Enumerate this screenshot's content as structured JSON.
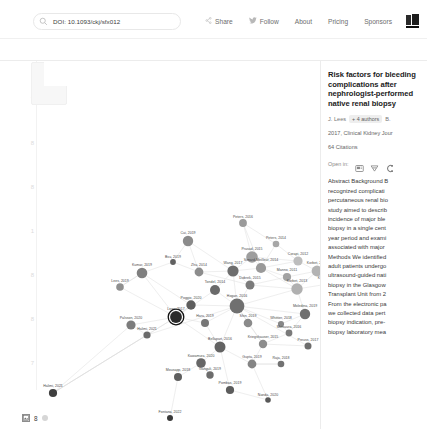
{
  "topbar": {
    "search": {
      "icon": "search-icon",
      "value": "DOI: 10.1093/ckj/sfx012",
      "placeholder": "Search"
    },
    "nav": [
      {
        "id": "share",
        "label": "Share",
        "icon": "share-icon"
      },
      {
        "id": "follow",
        "label": "Follow",
        "icon": "twitter-icon"
      },
      {
        "id": "about",
        "label": "About",
        "icon": ""
      },
      {
        "id": "pricing",
        "label": "Pricing",
        "icon": ""
      },
      {
        "id": "sponsors",
        "label": "Sponsors",
        "icon": ""
      }
    ],
    "logo": "book-logo-icon"
  },
  "subbar": {
    "breadcrumb": "ions after nephrologist-performed nativ...",
    "items": [
      {
        "id": "prior",
        "label": "Prior",
        "icon": ""
      },
      {
        "id": "derivative",
        "label": "Derivative",
        "icon": ""
      },
      {
        "id": "list",
        "label": "List",
        "icon": "list-icon"
      },
      {
        "id": "filters",
        "label": "Filters",
        "icon": "filters-icon"
      }
    ]
  },
  "graph": {
    "collapse_arrow": "◂",
    "y_ticks": [
      "7",
      "8",
      "8",
      "1",
      "8",
      "8",
      "7"
    ],
    "highlight_color": "#111111",
    "edge_color": "#d9d9d9"
  },
  "sidebar": {
    "title": "Risk factors for bleeding complications after nephrologist-performed native renal biopsy",
    "first_author": "J. Lees",
    "more_authors": "+ 4 authors",
    "last_author": "B.",
    "venue": "2017, Clinical Kidney Jour",
    "citations": "64 Citations",
    "open_in_label": "Open in:",
    "open_in_icons": [
      "semantic-scholar-icon",
      "scite-icon",
      "connected-papers-icon"
    ],
    "abstract_lines": [
      "Abstract Background B",
      "recognized complicati",
      "percutaneous renal bio",
      "study aimed to describ",
      "incidence of major ble",
      "biopsy in a single cent",
      "year period and exami",
      "associated with major",
      "Methods We identified",
      "adult patients undergo",
      "ultrasound-guided nati",
      "biopsy in the Glasgow",
      "Transplant Unit from 2",
      "From the electronic pa",
      "we collected data pert",
      "biopsy indication, pre-",
      "biopsy laboratory mea"
    ]
  },
  "footer": {
    "icon": "image-icon",
    "count": "8",
    "dot": "node-dot"
  },
  "chart_data": {
    "type": "scatter",
    "xlabel": "",
    "ylabel": "",
    "grid": false,
    "legend": null,
    "nodes": [
      {
        "label": "Peters, 2016",
        "x": 243,
        "y": 163,
        "r": 3.9,
        "shade": "#9a9a9a"
      },
      {
        "label": "Cui, 2019",
        "x": 188,
        "y": 181,
        "r": 5.2,
        "shade": "#8b8b8b"
      },
      {
        "label": "Peters, 2014",
        "x": 276,
        "y": 184,
        "r": 3.3,
        "shade": "#a6a6a6"
      },
      {
        "label": "Prasad, 2015",
        "x": 252,
        "y": 197,
        "r": 5.8,
        "shade": "#9e9e9e"
      },
      {
        "label": "Corapi, 2012",
        "x": 298,
        "y": 201,
        "r": 4.6,
        "shade": "#bdbdbd"
      },
      {
        "label": "Bsu, 2019",
        "x": 173,
        "y": 202,
        "r": 2.9,
        "shade": "#616161"
      },
      {
        "label": "Simard-Meilleur, 2014",
        "x": 261,
        "y": 208,
        "r": 5.1,
        "shade": "#999999"
      },
      {
        "label": "Korbet, 2012",
        "x": 317,
        "y": 211,
        "r": 5.4,
        "shade": "#b3b3b3"
      },
      {
        "label": "Kumar, 2019",
        "x": 142,
        "y": 213,
        "r": 5.3,
        "shade": "#7f7f7f"
      },
      {
        "label": "Zhu, 2014",
        "x": 199,
        "y": 212,
        "r": 4.4,
        "shade": "#8d8d8d"
      },
      {
        "label": "Wang, 2017",
        "x": 233,
        "y": 211,
        "r": 5.6,
        "shade": "#6e6e6e"
      },
      {
        "label": "Manno, 2011",
        "x": 287,
        "y": 217,
        "r": 4.1,
        "shade": "#a2a2a2"
      },
      {
        "label": "Korbet, 2012",
        "x": 328,
        "y": 224,
        "r": 3.0,
        "shade": "#9d9d9d"
      },
      {
        "label": "Dobrek, 2015",
        "x": 250,
        "y": 225,
        "r": 4.5,
        "shade": "#7b7b7b"
      },
      {
        "label": "Lees, 2019",
        "x": 120,
        "y": 227,
        "r": 3.8,
        "shade": "#8f8f8f"
      },
      {
        "label": "Tondel, 2014",
        "x": 215,
        "y": 230,
        "r": 5.0,
        "shade": "#6a6a6a"
      },
      {
        "label": "Korbet, 2013",
        "x": 297,
        "y": 229,
        "r": 5.7,
        "shade": "#b0b0b0"
      },
      {
        "label": "Poggio, 2020",
        "x": 191,
        "y": 245,
        "r": 4.7,
        "shade": "#5e5e5e"
      },
      {
        "label": "Hogan, 2016",
        "x": 237,
        "y": 246,
        "r": 7.4,
        "shade": "#707070"
      },
      {
        "label": "Moledina, 2019",
        "x": 305,
        "y": 254,
        "r": 5.2,
        "shade": "#6f6f6f"
      },
      {
        "label": "Lees, 2017",
        "x": 176,
        "y": 257,
        "r": 5.9,
        "shade": "#2a2a2a"
      },
      {
        "label": "Palsson, 2020",
        "x": 131,
        "y": 265,
        "r": 4.6,
        "shade": "#7c7c7c"
      },
      {
        "label": "Hara, 2019",
        "x": 205,
        "y": 263,
        "r": 4.0,
        "shade": "#777777"
      },
      {
        "label": "Shin, 2019",
        "x": 248,
        "y": 263,
        "r": 4.3,
        "shade": "#8a8a8a"
      },
      {
        "label": "Whittier, 2018",
        "x": 281,
        "y": 264,
        "r": 3.1,
        "shade": "#878787"
      },
      {
        "label": "Mutsuura, 2016",
        "x": 289,
        "y": 273,
        "r": 3.4,
        "shade": "#7a7a7a"
      },
      {
        "label": "Halimi, 2021",
        "x": 147,
        "y": 275,
        "r": 3.6,
        "shade": "#6b6b6b"
      },
      {
        "label": "Kriegshauser, 2015",
        "x": 263,
        "y": 284,
        "r": 4.2,
        "shade": "#8c8c8c"
      },
      {
        "label": "Preuss, 2017",
        "x": 308,
        "y": 286,
        "r": 3.5,
        "shade": "#6d6d6d"
      },
      {
        "label": "Bellapart, 2016",
        "x": 220,
        "y": 287,
        "r": 5.5,
        "shade": "#636363"
      },
      {
        "label": "Kawamura, 2020",
        "x": 201,
        "y": 303,
        "r": 4.8,
        "shade": "#666666"
      },
      {
        "label": "Gupta, 2019",
        "x": 252,
        "y": 304,
        "r": 4.4,
        "shade": "#848484"
      },
      {
        "label": "Raja, 2018",
        "x": 281,
        "y": 304,
        "r": 3.3,
        "shade": "#727272"
      },
      {
        "label": "Mousapp, 2018",
        "x": 178,
        "y": 317,
        "r": 4.0,
        "shade": "#5f5f5f"
      },
      {
        "label": "Ganguli, 2019",
        "x": 210,
        "y": 315,
        "r": 3.7,
        "shade": "#6c6c6c"
      },
      {
        "label": "Pombas, 2019",
        "x": 230,
        "y": 330,
        "r": 4.1,
        "shade": "#5c5c5c"
      },
      {
        "label": "Nanda, 2020",
        "x": 268,
        "y": 340,
        "r": 2.8,
        "shade": "#585858"
      },
      {
        "label": "Halimi, 2021",
        "x": 53,
        "y": 333,
        "r": 4.1,
        "shade": "#3f3f3f"
      },
      {
        "label": "Fontana, 2022",
        "x": 170,
        "y": 358,
        "r": 3.0,
        "shade": "#3a3a3a"
      }
    ],
    "highlighted_node": "Lees, 2017",
    "edges": [
      [
        0,
        3
      ],
      [
        0,
        6
      ],
      [
        0,
        2
      ],
      [
        1,
        10
      ],
      [
        1,
        9
      ],
      [
        2,
        6
      ],
      [
        2,
        4
      ],
      [
        3,
        6
      ],
      [
        3,
        10
      ],
      [
        3,
        4
      ],
      [
        4,
        6
      ],
      [
        4,
        7
      ],
      [
        5,
        9
      ],
      [
        5,
        8
      ],
      [
        6,
        10
      ],
      [
        6,
        11
      ],
      [
        6,
        16
      ],
      [
        7,
        11
      ],
      [
        7,
        12
      ],
      [
        7,
        16
      ],
      [
        8,
        14
      ],
      [
        8,
        17
      ],
      [
        8,
        20
      ],
      [
        9,
        10
      ],
      [
        9,
        13
      ],
      [
        10,
        13
      ],
      [
        10,
        15
      ],
      [
        10,
        18
      ],
      [
        11,
        13
      ],
      [
        11,
        16
      ],
      [
        12,
        16
      ],
      [
        13,
        16
      ],
      [
        13,
        18
      ],
      [
        14,
        20
      ],
      [
        15,
        18
      ],
      [
        15,
        20
      ],
      [
        16,
        18
      ],
      [
        16,
        19
      ],
      [
        17,
        20
      ],
      [
        17,
        18
      ],
      [
        18,
        19
      ],
      [
        18,
        22
      ],
      [
        18,
        23
      ],
      [
        18,
        27
      ],
      [
        18,
        29
      ],
      [
        19,
        24
      ],
      [
        19,
        25
      ],
      [
        20,
        21
      ],
      [
        20,
        22
      ],
      [
        20,
        26
      ],
      [
        20,
        29
      ],
      [
        20,
        17
      ],
      [
        21,
        26
      ],
      [
        22,
        29
      ],
      [
        23,
        27
      ],
      [
        24,
        25
      ],
      [
        25,
        27
      ],
      [
        26,
        37
      ],
      [
        27,
        28
      ],
      [
        27,
        31
      ],
      [
        29,
        30
      ],
      [
        29,
        31
      ],
      [
        29,
        35
      ],
      [
        30,
        33
      ],
      [
        30,
        34
      ],
      [
        31,
        32
      ],
      [
        31,
        36
      ],
      [
        33,
        38
      ],
      [
        35,
        36
      ],
      [
        26,
        18
      ],
      [
        37,
        20
      ],
      [
        37,
        26
      ],
      [
        12,
        7
      ],
      [
        34,
        30
      ],
      [
        32,
        31
      ],
      [
        28,
        18
      ],
      [
        24,
        18
      ],
      [
        21,
        37
      ],
      [
        14,
        8
      ],
      [
        5,
        1
      ]
    ]
  }
}
